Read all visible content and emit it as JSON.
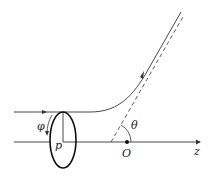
{
  "diagram": {
    "labels": {
      "phi": "φ",
      "p": "p",
      "theta": "θ",
      "origin": "O",
      "axis": "z"
    },
    "colors": {
      "line": "#333333",
      "background": "#ffffff"
    }
  }
}
